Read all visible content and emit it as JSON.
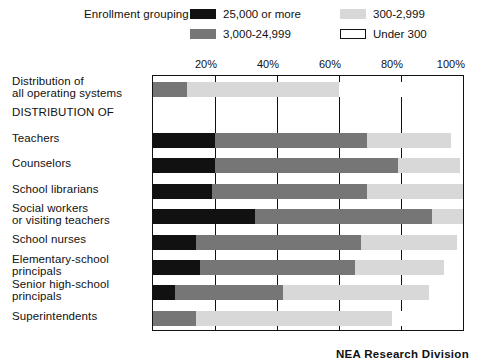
{
  "legend": {
    "title": "Enrollment grouping",
    "items": [
      {
        "label": "25,000 or more",
        "swatch": "black-swatch-icon",
        "color": "#111111"
      },
      {
        "label": "300-2,999",
        "swatch": "light-gray-swatch-icon",
        "color": "#d8d8d8"
      },
      {
        "label": "3,000-24,999",
        "swatch": "dark-gray-swatch-icon",
        "color": "#767676"
      },
      {
        "label": "Under 300",
        "swatch": "white-swatch-icon",
        "color": "#ffffff"
      }
    ]
  },
  "footer": {
    "credit": "NEA Research Division"
  },
  "chart_data": {
    "type": "bar",
    "orientation": "horizontal",
    "stacked": true,
    "title": "",
    "xlabel": "",
    "ylabel": "",
    "xlim": [
      0,
      100
    ],
    "xticks": [
      20,
      40,
      60,
      80,
      100
    ],
    "xtick_labels": [
      "20%",
      "40%",
      "60%",
      "80%",
      "100%"
    ],
    "grid": true,
    "legend_position": "top",
    "series": [
      {
        "name": "25,000 or more",
        "color": "#111111"
      },
      {
        "name": "3,000-24,999",
        "color": "#767676"
      },
      {
        "name": "300-2,999",
        "color": "#d8d8d8"
      },
      {
        "name": "Under 300",
        "color": "#ffffff"
      }
    ],
    "categories": [
      "Distribution of\nall operating systems",
      "DISTRIBUTION OF",
      "Teachers",
      "Counselors",
      "School librarians",
      "Social workers\nor visiting teachers",
      "School nurses",
      "Elementary-school\nprincipals",
      "Senior high-school\nprincipals",
      "Superintendents"
    ],
    "rows": [
      {
        "label": "Distribution of\nall operating systems",
        "is_heading": false,
        "segments": [
          {
            "series": "25,000 or more",
            "value": 0
          },
          {
            "series": "3,000-24,999",
            "value": 11
          },
          {
            "series": "300-2,999",
            "value": 49
          },
          {
            "series": "Under 300",
            "value": 40
          }
        ]
      },
      {
        "label": "DISTRIBUTION OF",
        "is_heading": true,
        "segments": []
      },
      {
        "label": "Teachers",
        "is_heading": false,
        "segments": [
          {
            "series": "25,000 or more",
            "value": 20
          },
          {
            "series": "3,000-24,999",
            "value": 49
          },
          {
            "series": "300-2,999",
            "value": 27
          },
          {
            "series": "Under 300",
            "value": 4
          }
        ]
      },
      {
        "label": "Counselors",
        "is_heading": false,
        "segments": [
          {
            "series": "25,000 or more",
            "value": 20
          },
          {
            "series": "3,000-24,999",
            "value": 59
          },
          {
            "series": "300-2,999",
            "value": 20
          },
          {
            "series": "Under 300",
            "value": 1
          }
        ]
      },
      {
        "label": "School librarians",
        "is_heading": false,
        "segments": [
          {
            "series": "25,000 or more",
            "value": 19
          },
          {
            "series": "3,000-24,999",
            "value": 50
          },
          {
            "series": "300-2,999",
            "value": 31
          },
          {
            "series": "Under 300",
            "value": 0
          }
        ]
      },
      {
        "label": "Social workers\nor visiting teachers",
        "is_heading": false,
        "segments": [
          {
            "series": "25,000 or more",
            "value": 33
          },
          {
            "series": "3,000-24,999",
            "value": 57
          },
          {
            "series": "300-2,999",
            "value": 10
          },
          {
            "series": "Under 300",
            "value": 0
          }
        ]
      },
      {
        "label": "School nurses",
        "is_heading": false,
        "segments": [
          {
            "series": "25,000 or more",
            "value": 14
          },
          {
            "series": "3,000-24,999",
            "value": 53
          },
          {
            "series": "300-2,999",
            "value": 31
          },
          {
            "series": "Under 300",
            "value": 2
          }
        ]
      },
      {
        "label": "Elementary-school\nprincipals",
        "is_heading": false,
        "segments": [
          {
            "series": "25,000 or more",
            "value": 15
          },
          {
            "series": "3,000-24,999",
            "value": 50
          },
          {
            "series": "300-2,999",
            "value": 29
          },
          {
            "series": "Under 300",
            "value": 6
          }
        ]
      },
      {
        "label": "Senior high-school\nprincipals",
        "is_heading": false,
        "segments": [
          {
            "series": "25,000 or more",
            "value": 7
          },
          {
            "series": "3,000-24,999",
            "value": 35
          },
          {
            "series": "300-2,999",
            "value": 47
          },
          {
            "series": "Under 300",
            "value": 11
          }
        ]
      },
      {
        "label": "Superintendents",
        "is_heading": false,
        "segments": [
          {
            "series": "25,000 or more",
            "value": 0
          },
          {
            "series": "3,000-24,999",
            "value": 14
          },
          {
            "series": "300-2,999",
            "value": 63
          },
          {
            "series": "Under 300",
            "value": 23
          }
        ]
      }
    ]
  }
}
